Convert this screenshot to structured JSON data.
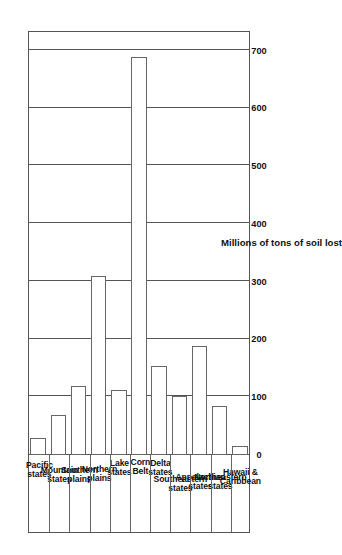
{
  "chart_data": {
    "type": "bar",
    "orientation": "horizontal",
    "title": "",
    "xlabel": "Millions of tons of soil lost",
    "ylabel": "",
    "categories": [
      "Pacific states",
      "Mountain states",
      "Southern plains",
      "Northern plains",
      "Lake states",
      "Corn Belt",
      "Delta states",
      "Southeastern states",
      "Appalachian states",
      "Northeastern states",
      "Hawaii & Caribbean"
    ],
    "category_lines": [
      [
        "Pacific",
        "states"
      ],
      [
        "Mountain",
        "states"
      ],
      [
        "Southern",
        "plains"
      ],
      [
        "Northern",
        "plains"
      ],
      [
        "Lake",
        "states"
      ],
      [
        "Corn",
        "Belt"
      ],
      [
        "Delta",
        "states"
      ],
      [
        "Southeastern",
        "states"
      ],
      [
        "Appalachian",
        "states"
      ],
      [
        "Northeastern",
        "states"
      ],
      [
        "Hawaii &",
        "Caribbean"
      ]
    ],
    "values": [
      30,
      70,
      120,
      310,
      112,
      690,
      155,
      103,
      188,
      85,
      15
    ],
    "xlim": [
      0,
      700
    ],
    "ticks": [
      0,
      100,
      200,
      300,
      400,
      500,
      600,
      700
    ],
    "tick_labels": [
      "0",
      "100",
      "200",
      "300",
      "400",
      "500",
      "600",
      "700"
    ],
    "grid": true,
    "legend": null,
    "bar_fill": "#ffffff",
    "bar_stroke": "#666666",
    "axis_color": "#555555"
  }
}
